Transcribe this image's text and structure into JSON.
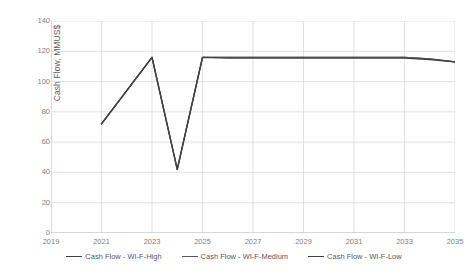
{
  "chart_data": {
    "type": "line",
    "title": "",
    "xlabel": "",
    "ylabel": "Cash Flow, MMUS$",
    "xlim": [
      2019,
      2035
    ],
    "ylim": [
      0,
      140
    ],
    "ytick_step": 20,
    "xtick_step": 2,
    "yticks": [
      "0",
      "20",
      "40",
      "60",
      "80",
      "100",
      "120",
      "140"
    ],
    "xticks": [
      "2019",
      "2021",
      "2023",
      "2025",
      "2027",
      "2029",
      "2031",
      "2033",
      "2035"
    ],
    "grid": true,
    "legend_position": "bottom",
    "series": [
      {
        "name": "Cash Flow - WI-F-High",
        "color": "#404040",
        "x": [
          2021,
          2023,
          2024,
          2025,
          2026,
          2027,
          2028,
          2029,
          2030,
          2031,
          2032,
          2033,
          2034,
          2035
        ],
        "values": [
          72,
          116,
          42,
          116,
          116,
          116,
          116,
          116,
          116,
          116,
          116,
          116,
          115,
          113
        ]
      },
      {
        "name": "Cash Flow - WI-F-Medium",
        "color": "#595959",
        "x": [
          2021,
          2023,
          2024,
          2025,
          2026,
          2027,
          2028,
          2029,
          2030,
          2031,
          2032,
          2033,
          2034,
          2035
        ],
        "values": [
          72,
          116,
          42,
          116,
          116,
          116,
          116,
          116,
          116,
          116,
          116,
          116,
          115,
          113
        ]
      },
      {
        "name": "Cash Flow - WI-F-Low",
        "color": "#404040",
        "x": [
          2021,
          2023,
          2024,
          2025,
          2026,
          2027,
          2028,
          2029,
          2030,
          2031,
          2032,
          2033,
          2034,
          2035
        ],
        "values": [
          72,
          116,
          42,
          116,
          115.5,
          115.5,
          115.5,
          115.5,
          115.5,
          115.5,
          115.5,
          115.5,
          114.5,
          113
        ]
      }
    ]
  },
  "legend": {
    "items": [
      {
        "label": "Cash Flow - WI-F-High"
      },
      {
        "label": "Cash Flow - WI-F-Medium"
      },
      {
        "label": "Cash Flow - WI-F-Low"
      }
    ]
  }
}
